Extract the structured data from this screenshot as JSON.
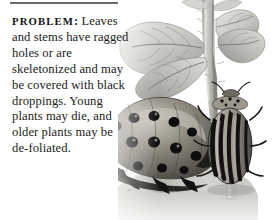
{
  "page": {
    "kind": "print-page-excerpt",
    "background_color": "#ffffff",
    "rule_color": "#6b6b6b"
  },
  "divider": {
    "name": "top-horizontal-rule"
  },
  "problem_block": {
    "label": "PROBLEM",
    "label_separator": ":",
    "text": " Leaves and stems have ragged holes or are skeletonized and may be covered with black droppings. Young plants may die, and older plants may be de-foliated.",
    "lines": [
      "Leaves",
      "and stems have",
      "ragged holes or are",
      "skeletonized and",
      "may be covered with",
      "black droppings.",
      "Young plants",
      "may die, and",
      "older plants",
      "may be de-",
      "foliated."
    ],
    "text_color": "#1b1b1b"
  },
  "photo": {
    "caption_absent": true,
    "subjects": [
      "potato-plant-stem",
      "potato-plant-leaves",
      "colorado-potato-beetle-larva",
      "colorado-potato-beetle-adult"
    ],
    "palette": {
      "leaf_light": "#dcdcd8",
      "leaf_mid": "#b9b9b4",
      "leaf_dark": "#8f8f8a",
      "stem_light": "#cfcfc9",
      "stem_dark": "#7d7d77",
      "larva_body": "#6e6a62",
      "larva_highlight": "#b6b2a8",
      "larva_spot": "#121212",
      "beetle_body": "#8a867c",
      "beetle_stripe": "#111111",
      "shadow": "#9a9a95"
    }
  }
}
